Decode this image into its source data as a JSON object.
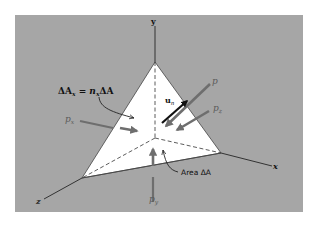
{
  "figure": {
    "background_color": "#ffffff",
    "panel_color": "#a6a6a6",
    "face_color": "#ffffff",
    "arrow_color": "#6e6e6e",
    "unit_vector_color": "#111111",
    "axes": {
      "x_label": "x",
      "y_label": "y",
      "z_label": "z"
    },
    "labels": {
      "delta_ax_lhs": "ΔA",
      "delta_ax_sub": "x",
      "delta_ax_eq": " = n",
      "delta_ax_nsub": "x",
      "delta_ax_rhs": "ΔA",
      "px_main": "p",
      "px_sub": "x",
      "py_main": "p",
      "py_sub": "y",
      "pz_main": "p",
      "pz_sub": "z",
      "p": "p",
      "un_main": "u",
      "un_sub": "n",
      "area": "Area ΔA"
    }
  }
}
